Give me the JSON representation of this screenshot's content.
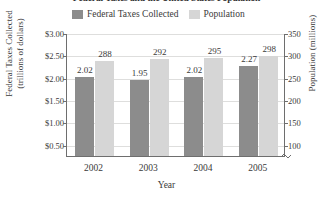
{
  "chart_data": {
    "type": "bar",
    "title": "Federal Taxes and the United States Population",
    "xlabel": "Year",
    "categories": [
      "2002",
      "2003",
      "2004",
      "2005"
    ],
    "series": [
      {
        "name": "Federal Taxes Collected",
        "axis": "left",
        "color": "#8c8c8c",
        "values": [
          2.02,
          1.95,
          2.02,
          2.27
        ],
        "value_labels": [
          "2.02",
          "1.95",
          "2.02",
          "2.27"
        ]
      },
      {
        "name": "Population",
        "axis": "right",
        "color": "#d6d6d6",
        "values": [
          288,
          292,
          295,
          298
        ],
        "value_labels": [
          "288",
          "292",
          "295",
          "298"
        ]
      }
    ],
    "left_axis": {
      "label_line1": "Federal Taxes Collected",
      "label_line2": "(trillions of dollars)",
      "ticks": [
        "$3.00",
        "$2.50",
        "$2.00",
        "$1.50",
        "$1.00",
        "$0.50"
      ],
      "tick_values": [
        3.0,
        2.5,
        2.0,
        1.5,
        1.0,
        0.5
      ],
      "ylim": [
        0.25,
        3.0
      ]
    },
    "right_axis": {
      "label": "Population (millions)",
      "ticks": [
        "350",
        "300",
        "250",
        "200",
        "150",
        "100"
      ],
      "tick_values": [
        350,
        300,
        250,
        200,
        150,
        100
      ],
      "ylim": [
        75,
        350
      ],
      "broken": true
    },
    "grid": true,
    "legend_position": "top"
  },
  "legend": {
    "entries": [
      {
        "label": "Federal Taxes Collected",
        "color": "#8c8c8c"
      },
      {
        "label": "Population",
        "color": "#d6d6d6"
      }
    ]
  }
}
